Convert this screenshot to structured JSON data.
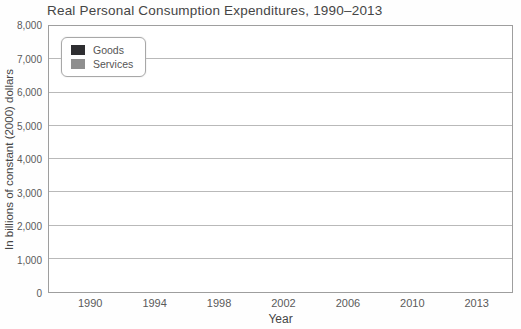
{
  "chart_data": {
    "type": "bar",
    "title": "Real Personal Consumption Expenditures, 1990–2013",
    "xlabel": "Year",
    "ylabel": "In billions of constant (2000) dollars",
    "categories": [
      "1990",
      "1994",
      "1998",
      "2002",
      "2006",
      "2010",
      "2013"
    ],
    "series": [
      {
        "name": "Goods",
        "color": "#2e2e31",
        "values": [
          3650,
          4050,
          4850,
          5950,
          7050,
          7100,
          7800
        ]
      },
      {
        "name": "Services",
        "color": "#8f8f8f",
        "values": [
          4100,
          4600,
          5300,
          6050,
          6700,
          6950,
          7300
        ]
      }
    ],
    "ylim": [
      0,
      8000
    ],
    "ytick_step": 1000,
    "ytick_labels": [
      "0",
      "1,000",
      "2,000",
      "3,000",
      "4,000",
      "5,000",
      "6,000",
      "7,000",
      "8,000"
    ],
    "grid": true,
    "legend_position": "top-left"
  },
  "colors": {
    "grid": "#b9b9b9",
    "plot_border": "#9e9e9e",
    "text": "#454545",
    "tick_text": "#5a5a5a",
    "background": "#fefefe"
  }
}
